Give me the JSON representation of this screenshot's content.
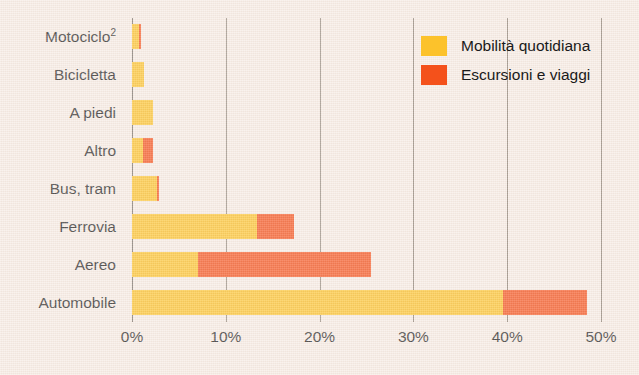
{
  "chart_data": {
    "type": "bar",
    "orientation": "horizontal",
    "stacked": true,
    "title": "",
    "xlabel": "",
    "ylabel": "",
    "xlim": [
      0,
      50
    ],
    "xticks": [
      0,
      10,
      20,
      30,
      40,
      50
    ],
    "xtick_labels": [
      "0%",
      "10%",
      "20%",
      "30%",
      "40%",
      "50%"
    ],
    "grid": true,
    "grid_axis": "x",
    "legend_position": "top-right",
    "categories": [
      "Motociclo",
      "Bicicletta",
      "A piedi",
      "Altro",
      "Bus, tram",
      "Ferrovia",
      "Aereo",
      "Automobile"
    ],
    "category_footnotes": [
      "2",
      "",
      "",
      "",
      "",
      "",
      "",
      ""
    ],
    "series": [
      {
        "name": "Mobilità quotidiana",
        "color": "#fcc22b",
        "values": [
          0.7,
          1.3,
          2.2,
          1.2,
          2.7,
          13.3,
          7.0,
          39.5
        ]
      },
      {
        "name": "Escursioni e viaggi",
        "color": "#f4511b",
        "values": [
          0.3,
          0.0,
          0.0,
          1.0,
          0.2,
          4.0,
          18.5,
          9.0
        ]
      }
    ],
    "totals": [
      1.0,
      1.3,
      2.2,
      2.2,
      2.9,
      17.3,
      25.5,
      48.5
    ]
  },
  "legend": {
    "items": [
      {
        "label": "Mobilità quotidiana",
        "color": "#fcc22b"
      },
      {
        "label": "Escursioni e viaggi",
        "color": "#f4511b"
      }
    ]
  },
  "colors": {
    "background": "#f7ece5",
    "primary": "#fcc22b",
    "secondary": "#f4511b",
    "gridline": "#8d8276",
    "text": "#1a1a1a"
  }
}
